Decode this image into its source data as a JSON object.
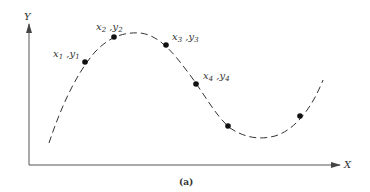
{
  "diagram": {
    "axes": {
      "x_label": "X",
      "y_label": "Y",
      "color": "#555555"
    },
    "curve": {
      "style": "dashed",
      "color": "#333333"
    },
    "points": [
      {
        "label": "x1,y1",
        "x_sub": "1",
        "y_sub": "1",
        "cx": 85,
        "cy": 62
      },
      {
        "label": "x2,y2",
        "x_sub": "2",
        "y_sub": "2",
        "cx": 114,
        "cy": 37
      },
      {
        "label": "x3,y3",
        "x_sub": "3",
        "y_sub": "3",
        "cx": 166,
        "cy": 45
      },
      {
        "label": "x4,y4",
        "x_sub": "4",
        "y_sub": "4",
        "cx": 196,
        "cy": 84
      },
      {
        "label": "",
        "cx": 228,
        "cy": 126
      },
      {
        "label": "",
        "cx": 300,
        "cy": 116
      }
    ],
    "caption": "(a)"
  }
}
